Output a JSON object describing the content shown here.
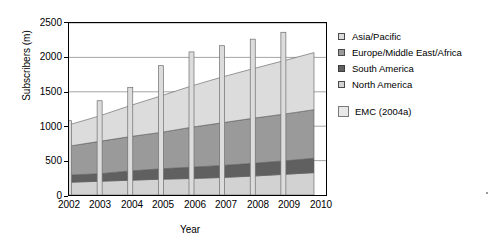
{
  "chart_data": {
    "type": "area",
    "title": "",
    "xlabel": "Year",
    "ylabel": "Subscribers (m)",
    "categories": [
      "2002",
      "2003",
      "2004",
      "2005",
      "2006",
      "2007",
      "2008",
      "2009",
      "2010"
    ],
    "x": [
      2002,
      2003,
      2004,
      2005,
      2006,
      2007,
      2008,
      2009,
      2010
    ],
    "ylim": [
      0,
      2500
    ],
    "yticks": [
      0,
      500,
      1000,
      1500,
      2000,
      2500
    ],
    "ytick_labels": [
      "0",
      "500",
      "1000",
      "1500",
      "2000",
      "2500"
    ],
    "grid": true,
    "legend_position": "right",
    "stacked": true,
    "stack_order_bottom_to_top": [
      "North America",
      "South America",
      "Europe/Middle East/Africa",
      "Asia/Pacific"
    ],
    "series": [
      {
        "name": "North America",
        "color": "#d2d2d2",
        "values": [
          185,
          200,
          215,
          230,
          240,
          255,
          275,
          300,
          325
        ]
      },
      {
        "name": "South America",
        "color": "#606060",
        "values": [
          105,
          110,
          135,
          150,
          165,
          175,
          185,
          195,
          210
        ]
      },
      {
        "name": "Europe/Middle East/Africa",
        "color": "#9a9a9a",
        "values": [
          420,
          470,
          500,
          530,
          580,
          620,
          655,
          680,
          705
        ]
      },
      {
        "name": "Asia/Pacific",
        "color": "#dcdcdc",
        "values": [
          310,
          370,
          450,
          530,
          600,
          665,
          720,
          775,
          830
        ]
      }
    ],
    "cumulative_totals": [
      1020,
      1150,
      1300,
      1440,
      1585,
      1715,
      1835,
      1950,
      2070
    ],
    "overlay_bars": {
      "name": "EMC (2004a)",
      "color": "#dcdcdc",
      "categories": [
        "2002",
        "2003",
        "2004",
        "2005",
        "2006",
        "2007",
        "2008",
        "2009"
      ],
      "values": [
        1080,
        1370,
        1565,
        1880,
        2080,
        2170,
        2265,
        2365
      ]
    }
  },
  "axes": {
    "y_title": "Subscribers (m)",
    "x_title": "Year",
    "y_tick_labels": [
      "2500",
      "2000",
      "1500",
      "1000",
      "500",
      "0"
    ],
    "x_tick_labels": [
      "2002",
      "2003",
      "2004",
      "2005",
      "2006",
      "2007",
      "2008",
      "2009",
      "2010"
    ]
  },
  "legend": {
    "items": [
      {
        "label": "Asia/Pacific",
        "swatch": "#dcdcdc"
      },
      {
        "label": "Europe/Middle East/Africa",
        "swatch": "#9a9a9a"
      },
      {
        "label": "South America",
        "swatch": "#606060"
      },
      {
        "label": "North America",
        "swatch": "#d2d2d2"
      }
    ],
    "source": {
      "label": "EMC (2004a)",
      "swatch": "#e8e8e8"
    }
  }
}
